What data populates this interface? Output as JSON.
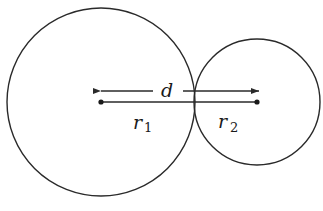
{
  "diagram": {
    "stroke_color": "#2a2a2a",
    "background": "#ffffff",
    "circles": [
      {
        "name": "circle-1",
        "cx": 101,
        "cy": 102,
        "r": 94
      },
      {
        "name": "circle-2",
        "cx": 257,
        "cy": 102,
        "r": 63
      }
    ],
    "labels": {
      "distance": "d",
      "radius1_main": "r",
      "radius1_sub": "1",
      "radius2_main": "r",
      "radius2_sub": "2"
    }
  }
}
